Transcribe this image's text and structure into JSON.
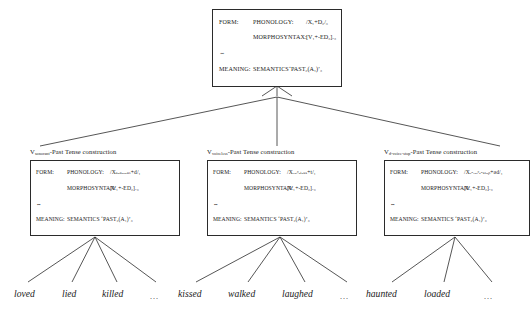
{
  "diagram": {
    "link_symbol": "⇔",
    "labels": {
      "form": "FORM:",
      "meaning": "MEANING:",
      "phonology": "PHONOLOGY:",
      "morphosyntax": "MORPHOSYNTAX:",
      "semantics": "SEMANTICS"
    }
  },
  "top_box": {
    "name": "schematic Past Tense construction",
    "phonology_value": "/X₁+D₂/₃",
    "morphosyntax_value": "[V₁+-ED₂]ᵥ₃",
    "semantics_value": "‘PAST₂(A₁)’₃"
  },
  "sub_constructions": [
    {
      "id": "sonorant",
      "title_base": "V",
      "title_subscript": "sonorant",
      "title_rest": "-Past Tense construction",
      "phonology_value": "/Xₛₒₙₒᵣₐₙₜ+d/₁",
      "morphosyntax_value": "[V₁+-ED₂]ᵥ₃",
      "semantics_value": "‘PAST₂(A₁)’₃",
      "examples": [
        "loved",
        "lied",
        "killed",
        "..."
      ]
    },
    {
      "id": "voiceless",
      "title_base": "V",
      "title_subscript": "voiceless",
      "title_rest": "-Past Tense construction",
      "phonology_value": "/Xᵥₒᵢᶜₑₗₑₛₛ+t/₁",
      "morphosyntax_value": "[V₁+-ED₂]ᵥ₃",
      "semantics_value": "‘PAST₂(A₁)’₃",
      "examples": [
        "kissed",
        "walked",
        "laughed",
        "..."
      ]
    },
    {
      "id": "d-voice-stop",
      "title_base": "V",
      "title_subscript": "d-voice-stop",
      "title_rest": "-Past Tense construction",
      "phonology_value": "/Xₔ-ᵥₒᵢᶜₑ-ₛₜₒₚ+əd/₁",
      "morphosyntax_value": "[V₁+-ED₂]ᵥ₃",
      "semantics_value": "‘PAST₂(A₁)’₃",
      "examples": [
        "haunted",
        "loaded",
        "..."
      ]
    }
  ],
  "words": [
    {
      "text": "loved",
      "x": 14
    },
    {
      "text": "lied",
      "x": 62
    },
    {
      "text": "killed",
      "x": 102
    },
    {
      "text": "...",
      "x": 150
    },
    {
      "text": "kissed",
      "x": 178
    },
    {
      "text": "walked",
      "x": 228
    },
    {
      "text": "laughed",
      "x": 282
    },
    {
      "text": "...",
      "x": 340
    },
    {
      "text": "haunted",
      "x": 366
    },
    {
      "text": "loaded",
      "x": 424
    },
    {
      "text": "...",
      "x": 484
    }
  ]
}
